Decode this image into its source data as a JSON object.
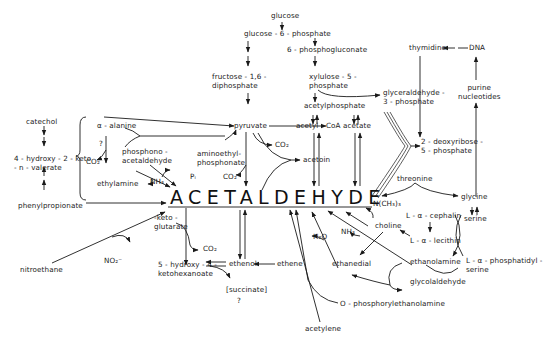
{
  "diagram": {
    "title": "ACETALDEHYDE",
    "nodes": {
      "glucose": "glucose",
      "glucose_6_phosphate": "glucose - 6 - phosphate",
      "six_phosphogluconate": "6 - phosphogluconate",
      "fructose_16_diphosphate": [
        "fructose - 1,6 -",
        "diphosphate"
      ],
      "xylulose_5_phosphate": [
        "xylulose - 5 -",
        "phosphate"
      ],
      "glyceraldehyde_3_phosphate": [
        "glyceraldehyde -",
        "3 - phosphate"
      ],
      "thymidine": "thymidine",
      "dna": "DNA",
      "purine_nucleotides": [
        "purine",
        "nucleotides"
      ],
      "acetylphosphate": "acetylphosphate",
      "pyruvate": "pyruvate",
      "acetyl_coa": "acetyl - CoA",
      "acetate": "acetate",
      "deoxyribose_5_phosphate": [
        "2 - deoxyribose -",
        "5 - phosphate"
      ],
      "catechol": "catechol",
      "hydroxy_keto_valerate": [
        "4 - hydroxy - 2 - keto",
        "- n - valerate"
      ],
      "phenylpropionate": "phenylpropionate",
      "alpha_alanine": "α - alanine",
      "question_1": "?",
      "co2_1": "CO₂",
      "phosphonoacetaldehyde": [
        "phosphono -",
        "acetaldehyde"
      ],
      "aminoethylphosphonate": [
        "aminoethyl-",
        "phosphonate"
      ],
      "co2_2": "CO₂",
      "acetoin": "acetoin",
      "co2_3": "CO₂",
      "ethylamine": "ethylamine",
      "nh3_1": "NH₃",
      "pi": "Pᵢ",
      "threonine": "threonine",
      "glycine": "glycine",
      "serine": "serine",
      "n_ch3_3": "N(CH₃)₃",
      "l_alpha_cephalin": "L - α - cephalin",
      "choline": "choline",
      "l_alpha_lecithin": "L - α - lecithin",
      "nh3_2": "NH₃",
      "h2o": "H₂O",
      "ethanedial": "ethanedial",
      "ethanolamine": "ethanolamine",
      "l_alpha_phosphatidylserine": [
        "L - α - phosphatidyl -",
        "serine"
      ],
      "glycolaldehyde": "glycolaldehyde",
      "alpha_ketoglutarate": [
        "-keto -",
        "glutarate"
      ],
      "co2_4": "CO₂",
      "hydroxy_ketohexanoate": [
        "5 - hydroxy - 4 -",
        "ketohexanoate"
      ],
      "ethenol": "ethenol",
      "ethene": "ethene",
      "succinate": "[succinate]",
      "question_2": "?",
      "nitroethane": "nitroethane",
      "no2": "NO₂⁻",
      "o_phosphorylethanolamine": "O - phosphorylethanolamine",
      "acetylene": "acetylene"
    },
    "colors": {
      "ink": "#1a1a1a",
      "background": "#ffffff"
    }
  }
}
